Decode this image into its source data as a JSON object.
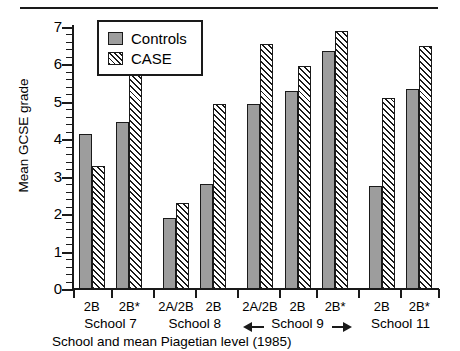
{
  "chart_data": {
    "type": "bar",
    "title": "",
    "xlabel": "School and mean Piagetian level (1985)",
    "ylabel": "Mean GCSE grade",
    "ylim": [
      0,
      7
    ],
    "ytick_step": 1,
    "yminor_step": 0.2,
    "grid": false,
    "legend_position": "top-left",
    "categories": [
      "2B",
      "2B*",
      "2A/2B",
      "2B",
      "2A/2B",
      "2B",
      "2B*",
      "2B",
      "2B*"
    ],
    "ytick_labels": [
      "0",
      "1",
      "2",
      "3",
      "4",
      "5",
      "6",
      "7"
    ],
    "series": [
      {
        "name": "Controls",
        "color": "#9d9d9d",
        "fill": "solid-grey",
        "values": [
          4.15,
          4.45,
          1.9,
          2.8,
          4.95,
          5.3,
          6.35,
          2.75,
          5.35
        ]
      },
      {
        "name": "CASE",
        "color": "#ffffff",
        "fill": "diagonal-hatch",
        "values": [
          3.3,
          5.75,
          2.3,
          4.95,
          6.55,
          5.95,
          6.9,
          5.1,
          6.5
        ]
      }
    ],
    "groups": [
      {
        "label": "School 7",
        "categories": [
          "2B",
          "2B*"
        ],
        "arrows": false
      },
      {
        "label": "School 8",
        "categories": [
          "2A/2B",
          "2B"
        ],
        "arrows": false
      },
      {
        "label": "School 9",
        "categories": [
          "2A/2B",
          "2B",
          "2B*"
        ],
        "arrows": true
      },
      {
        "label": "School 11",
        "categories": [
          "2B",
          "2B*"
        ],
        "arrows": false
      }
    ]
  },
  "legend": {
    "entries": [
      {
        "label": "Controls",
        "swatch": "solid-grey-square-icon"
      },
      {
        "label": "CASE",
        "swatch": "hatched-square-icon"
      }
    ]
  },
  "axes": {
    "y_title": "Mean GCSE grade",
    "x_title": "School and mean Piagetian level (1985)"
  }
}
